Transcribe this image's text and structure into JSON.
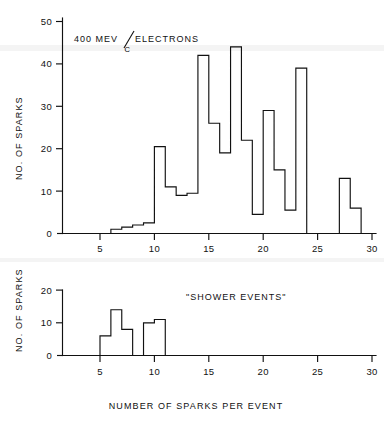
{
  "figure": {
    "caption_x": "NUMBER OF SPARKS PER EVENT",
    "ink_color": "#111111",
    "background_color": "#ffffff"
  },
  "upper": {
    "annotation_main": "400 MEV",
    "annotation_slash": "/",
    "annotation_denominator": "C",
    "annotation_tail": "ELECTRONS",
    "ylabel": "NO. OF SPARKS",
    "ytick_labels": [
      "0",
      "10",
      "20",
      "30",
      "40",
      "50"
    ],
    "xtick_labels": [
      "5",
      "10",
      "15",
      "20",
      "25",
      "30"
    ]
  },
  "lower": {
    "annotation": "\"SHOWER EVENTS\"",
    "ylabel": "NO. OF SPARKS",
    "ytick_labels": [
      "0",
      "10",
      "20"
    ],
    "xtick_labels": [
      "5",
      "10",
      "15",
      "20",
      "25",
      "30"
    ]
  },
  "chart_data": [
    {
      "type": "bar",
      "title": "400 MEV/C ELECTRONS",
      "xlabel": "NUMBER OF SPARKS PER EVENT",
      "ylabel": "NO. OF SPARKS",
      "xlim": [
        0,
        30
      ],
      "ylim": [
        0,
        50
      ],
      "xticks": [
        5,
        10,
        15,
        20,
        25,
        30
      ],
      "yticks": [
        0,
        10,
        20,
        30,
        40,
        50
      ],
      "grid": false,
      "legend": "none",
      "bin_width": 1,
      "categories": [
        6,
        7,
        8,
        9,
        10,
        11,
        12,
        13,
        14,
        15,
        16,
        17,
        18,
        19,
        20,
        21,
        22,
        23,
        27,
        28
      ],
      "values": [
        1,
        1.5,
        2,
        2.5,
        20.5,
        11,
        9,
        9.5,
        42,
        26,
        19,
        44,
        22,
        4.5,
        29,
        15,
        5.5,
        39,
        13,
        6
      ]
    },
    {
      "type": "bar",
      "title": "\"SHOWER EVENTS\"",
      "xlabel": "NUMBER OF SPARKS PER EVENT",
      "ylabel": "NO. OF SPARKS",
      "xlim": [
        0,
        30
      ],
      "ylim": [
        0,
        20
      ],
      "xticks": [
        5,
        10,
        15,
        20,
        25,
        30
      ],
      "yticks": [
        0,
        10,
        20
      ],
      "grid": false,
      "legend": "none",
      "bin_width": 1,
      "categories": [
        5,
        6,
        7,
        9,
        10
      ],
      "values": [
        6,
        14,
        8,
        10,
        11
      ]
    }
  ]
}
